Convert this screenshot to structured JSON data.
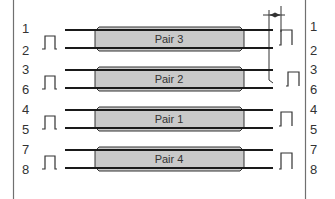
{
  "diagram": {
    "colors": {
      "background": "#ffffff",
      "border": "#707070",
      "wire": "#1a1a1a",
      "jacket_fill": "#c9c9c9",
      "jacket_stroke": "#333333",
      "text": "#333333"
    },
    "pairs": [
      {
        "label": "Pair 3",
        "left_pins": [
          "1",
          "2"
        ],
        "right_pins": [
          "1",
          "2"
        ]
      },
      {
        "label": "Pair 2",
        "left_pins": [
          "3",
          "6"
        ],
        "right_pins": [
          "3",
          "6"
        ]
      },
      {
        "label": "Pair 1",
        "left_pins": [
          "4",
          "5"
        ],
        "right_pins": [
          "4",
          "5"
        ]
      },
      {
        "label": "Pair 4",
        "left_pins": [
          "7",
          "8"
        ],
        "right_pins": [
          "7",
          "8"
        ]
      }
    ],
    "pulse_icon": "square-pulse-icon",
    "skew_indicator": "skew-arrows-icon"
  }
}
